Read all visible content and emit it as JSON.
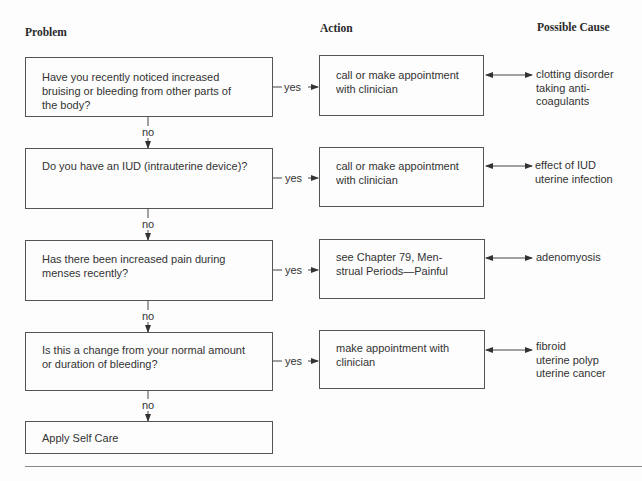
{
  "headers": {
    "problem": "Problem",
    "action": "Action",
    "cause": "Possible Cause"
  },
  "rows": [
    {
      "question": "Have you recently noticed increased\nbruising or bleeding from other parts of\nthe body?",
      "yes_label": "yes",
      "action": "call or make appointment\nwith clinician",
      "causes": "clotting disorder\ntaking anti-\n    coagulants",
      "no_label": "no"
    },
    {
      "question": "Do you have an IUD (intrauterine device)?",
      "yes_label": "yes",
      "action": "call or make appointment\nwith clinician",
      "causes": "effect of IUD\nuterine infection",
      "no_label": "no"
    },
    {
      "question": "Has there been increased pain during\nmenses recently?",
      "yes_label": "yes",
      "action": "see Chapter 79, Men-\nstrual Periods—Painful",
      "causes": "adenomyosis",
      "no_label": "no"
    },
    {
      "question": "Is this a change from your normal amount\nor duration of bleeding?",
      "yes_label": "yes",
      "action": "make appointment with\nclinician",
      "causes": "fibroid\nuterine polyp\nuterine cancer",
      "no_label": "no"
    }
  ],
  "final": {
    "label": "Apply Self Care"
  }
}
